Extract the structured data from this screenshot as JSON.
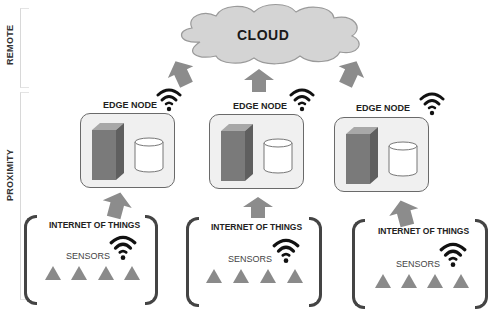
{
  "zones": {
    "remote_label": "REMOTE",
    "proximity_label": "PROXIMITY"
  },
  "cloud": {
    "label": "CLOUD",
    "fill": "#d4d4d4",
    "stroke": "#9a9a9a"
  },
  "edge_nodes": [
    {
      "title": "EDGE NODE"
    },
    {
      "title": "EDGE NODE"
    },
    {
      "title": "EDGE NODE"
    }
  ],
  "iot_groups": [
    {
      "title": "INTERNET OF THINGS",
      "sensors_label": "SENSORS",
      "sensor_count": 4
    },
    {
      "title": "INTERNET OF THINGS",
      "sensors_label": "SENSORS",
      "sensor_count": 4
    },
    {
      "title": "INTERNET OF THINGS",
      "sensors_label": "SENSORS",
      "sensor_count": 4
    }
  ],
  "colors": {
    "arrow": "#8c8c8c",
    "server": "#7a7a7a",
    "sensor": "#8a8a8a",
    "wifi": "#111111"
  }
}
